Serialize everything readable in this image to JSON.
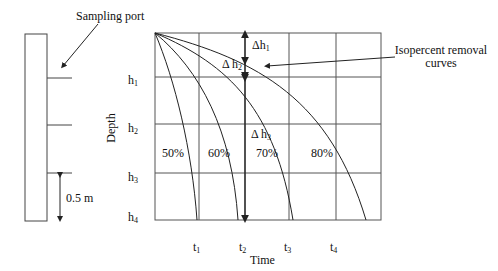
{
  "column": {
    "sampling_port_label": "Sampling port",
    "spacing_label": "0.5 m"
  },
  "chart": {
    "xlabel": "Time",
    "ylabel": "Depth",
    "depth_ticks": [
      {
        "base": "h",
        "sub": "1"
      },
      {
        "base": "h",
        "sub": "2"
      },
      {
        "base": "h",
        "sub": "3"
      },
      {
        "base": "h",
        "sub": "4"
      }
    ],
    "time_ticks": [
      {
        "base": "t",
        "sub": "1"
      },
      {
        "base": "t",
        "sub": "2"
      },
      {
        "base": "t",
        "sub": "3"
      },
      {
        "base": "t",
        "sub": "4"
      }
    ],
    "curve_labels": [
      "50%",
      "60%",
      "70%",
      "80%"
    ],
    "delta_labels": [
      {
        "base": "Δh",
        "sub": "1"
      },
      {
        "base": "Δ h",
        "sub": "2"
      },
      {
        "base": "Δ h",
        "sub": "3"
      }
    ],
    "annotation": {
      "line1": "Isopercent removal",
      "line2": "curves"
    }
  },
  "colors": {
    "line": "#222222",
    "grid": "#555555",
    "background": "#ffffff"
  }
}
